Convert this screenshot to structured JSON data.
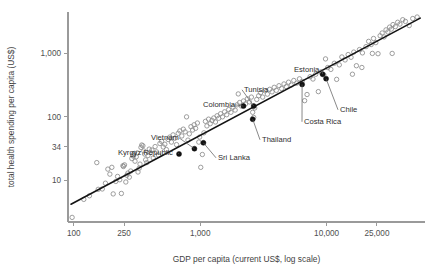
{
  "chart_data": {
    "type": "scatter",
    "title": "",
    "xlabel": "GDP per capita (current US$, log scale)",
    "ylabel": "total health spending per capita (US$)",
    "xscale": "log",
    "yscale": "log",
    "grid": false,
    "legend": "none",
    "xlim": [
      90,
      60000
    ],
    "ylim": [
      2.2,
      4500
    ],
    "xticks": [
      {
        "value": 100,
        "label": "100"
      },
      {
        "value": 250,
        "label": "250"
      },
      {
        "value": 1000,
        "label": "1,000"
      },
      {
        "value": 10000,
        "label": "10,000"
      },
      {
        "value": 25000,
        "label": "25,000"
      }
    ],
    "yticks": [
      {
        "value": 1000,
        "label": "1,000"
      },
      {
        "value": 100,
        "label": "100"
      },
      {
        "value": 34,
        "label": "34"
      },
      {
        "value": 10,
        "label": "10"
      }
    ],
    "trendline": {
      "x": [
        95,
        55000
      ],
      "y": [
        4.2,
        3600
      ]
    },
    "series": [
      {
        "name": "countries",
        "marker": "open-circle",
        "points": [
          [
            97,
            2.6
          ],
          [
            120,
            5.0
          ],
          [
            133,
            5.7
          ],
          [
            152,
            19.0
          ],
          [
            156,
            7.2
          ],
          [
            168,
            7.3
          ],
          [
            178,
            9.0
          ],
          [
            186,
            15.0
          ],
          [
            193,
            12.5
          ],
          [
            200,
            16.0
          ],
          [
            205,
            6.1
          ],
          [
            215,
            9.6
          ],
          [
            222,
            11.5
          ],
          [
            231,
            10.2
          ],
          [
            238,
            6.2
          ],
          [
            245,
            17.0
          ],
          [
            247,
            16.5
          ],
          [
            252,
            17.5
          ],
          [
            258,
            9.4
          ],
          [
            263,
            12.0
          ],
          [
            268,
            13.0
          ],
          [
            275,
            11.2
          ],
          [
            282,
            14.0
          ],
          [
            288,
            22.0
          ],
          [
            292,
            25.0
          ],
          [
            296,
            24.0
          ],
          [
            301,
            26.5
          ],
          [
            305,
            20.0
          ],
          [
            312,
            23.5
          ],
          [
            318,
            27.0
          ],
          [
            322,
            13.5
          ],
          [
            329,
            15.5
          ],
          [
            334,
            18.0
          ],
          [
            340,
            33.0
          ],
          [
            345,
            36.0
          ],
          [
            352,
            35.0
          ],
          [
            358,
            29.0
          ],
          [
            363,
            26.0
          ],
          [
            370,
            21.0
          ],
          [
            378,
            19.0
          ],
          [
            386,
            24.5
          ],
          [
            395,
            31.0
          ],
          [
            404,
            27.5
          ],
          [
            415,
            30.0
          ],
          [
            425,
            22.5
          ],
          [
            440,
            34.0
          ],
          [
            452,
            28.0
          ],
          [
            468,
            25.0
          ],
          [
            480,
            38.0
          ],
          [
            495,
            41.0
          ],
          [
            510,
            33.5
          ],
          [
            525,
            37.0
          ],
          [
            540,
            30.5
          ],
          [
            558,
            44.0
          ],
          [
            575,
            48.0
          ],
          [
            592,
            40.0
          ],
          [
            610,
            52.0
          ],
          [
            630,
            46.0
          ],
          [
            650,
            36.5
          ],
          [
            670,
            55.0
          ],
          [
            690,
            60.0
          ],
          [
            715,
            50.0
          ],
          [
            735,
            64.0
          ],
          [
            760,
            58.0
          ],
          [
            780,
            100.0
          ],
          [
            800,
            43.0
          ],
          [
            820,
            54.0
          ],
          [
            845,
            70.0
          ],
          [
            870,
            62.0
          ],
          [
            895,
            75.0
          ],
          [
            920,
            66.0
          ],
          [
            950,
            80.0
          ],
          [
            975,
            40.0
          ],
          [
            990,
            48.0
          ],
          [
            1010,
            16.0
          ],
          [
            1040,
            25.5
          ],
          [
            1070,
            56.0
          ],
          [
            1100,
            85.0
          ],
          [
            1130,
            72.0
          ],
          [
            1165,
            92.0
          ],
          [
            1200,
            78.0
          ],
          [
            1240,
            88.0
          ],
          [
            1280,
            96.0
          ],
          [
            1320,
            83.0
          ],
          [
            1360,
            104.0
          ],
          [
            1400,
            95.0
          ],
          [
            1450,
            112.0
          ],
          [
            1500,
            100.0
          ],
          [
            1560,
            120.0
          ],
          [
            1620,
            108.0
          ],
          [
            1680,
            130.0
          ],
          [
            1750,
            118.0
          ],
          [
            1820,
            142.0
          ],
          [
            1890,
            128.0
          ],
          [
            1960,
            155.0
          ],
          [
            2000,
            230.0
          ],
          [
            2050,
            168.0
          ],
          [
            2120,
            148.0
          ],
          [
            2200,
            178.0
          ],
          [
            2280,
            160.0
          ],
          [
            2360,
            192.0
          ],
          [
            2450,
            172.0
          ],
          [
            2540,
            205.0
          ],
          [
            2600,
            118.0
          ],
          [
            2650,
            98.0
          ],
          [
            2700,
            138.0
          ],
          [
            2800,
            188.0
          ],
          [
            2900,
            215.0
          ],
          [
            3000,
            240.0
          ],
          [
            3120,
            205.0
          ],
          [
            3250,
            258.0
          ],
          [
            3400,
            228.0
          ],
          [
            3550,
            272.0
          ],
          [
            3700,
            248.0
          ],
          [
            3850,
            292.0
          ],
          [
            4000,
            262.0
          ],
          [
            4200,
            310.0
          ],
          [
            4400,
            280.0
          ],
          [
            4600,
            330.0
          ],
          [
            4800,
            300.0
          ],
          [
            5000,
            352.0
          ],
          [
            5250,
            318.0
          ],
          [
            5500,
            375.0
          ],
          [
            5800,
            340.0
          ],
          [
            6100,
            398.0
          ],
          [
            6400,
            362.0
          ],
          [
            6700,
            180.0
          ],
          [
            7000,
            225.0
          ],
          [
            7400,
            430.0
          ],
          [
            7800,
            395.0
          ],
          [
            8200,
            470.0
          ],
          [
            8600,
            250.0
          ],
          [
            9000,
            510.0
          ],
          [
            9500,
            460.0
          ],
          [
            9800,
            820.0
          ],
          [
            10200,
            600.0
          ],
          [
            10800,
            560.0
          ],
          [
            11500,
            700.0
          ],
          [
            12000,
            390.0
          ],
          [
            12600,
            660.0
          ],
          [
            13200,
            880.0
          ],
          [
            14000,
            790.0
          ],
          [
            14800,
            960.0
          ],
          [
            15600,
            870.0
          ],
          [
            16400,
            1050.0
          ],
          [
            17200,
            640.0
          ],
          [
            18200,
            1150.0
          ],
          [
            19200,
            1020.0
          ],
          [
            20500,
            1280.0
          ],
          [
            21500,
            1550.0
          ],
          [
            22500,
            1380.0
          ],
          [
            23500,
            1720.0
          ],
          [
            24500,
            1480.0
          ],
          [
            25500,
            990.0
          ],
          [
            26500,
            1900.0
          ],
          [
            27500,
            2100.0
          ],
          [
            28500,
            1820.0
          ],
          [
            29500,
            2350.0
          ],
          [
            30500,
            2180.0
          ],
          [
            31500,
            2600.0
          ],
          [
            32500,
            2420.0
          ],
          [
            33500,
            2850.0
          ],
          [
            35000,
            2650.0
          ],
          [
            36500,
            3100.0
          ],
          [
            38000,
            2900.0
          ],
          [
            40000,
            3400.0
          ],
          [
            42000,
            3200.0
          ],
          [
            45000,
            2750.0
          ],
          [
            48000,
            3550.0
          ],
          [
            52000,
            3750.0
          ],
          [
            33000,
            1000.0
          ],
          [
            23000,
            1000.0
          ],
          [
            19000,
            600.0
          ],
          [
            16000,
            470.0
          ]
        ]
      }
    ],
    "highlighted": [
      {
        "name": "Kyrgyz Republic",
        "x": 680,
        "y": 26.0,
        "label_x": 118,
        "label_y": 155
      },
      {
        "name": "Vietnam",
        "x": 900,
        "y": 31.5,
        "label_x": 151,
        "label_y": 140
      },
      {
        "name": "Sri Lanka",
        "x": 1060,
        "y": 39.0,
        "label_x": 218,
        "label_y": 160
      },
      {
        "name": "Colombia",
        "x": 2200,
        "y": 148.0,
        "label_x": 203,
        "label_y": 107
      },
      {
        "name": "Thailand",
        "x": 2600,
        "y": 92.0,
        "label_x": 262,
        "label_y": 142
      },
      {
        "name": "Tunisia",
        "x": 2650,
        "y": 148.0,
        "label_x": 244,
        "label_y": 92
      },
      {
        "name": "Costa Rica",
        "x": 6400,
        "y": 325.0,
        "label_x": 304,
        "label_y": 124
      },
      {
        "name": "Estonia",
        "x": 9300,
        "y": 470.0,
        "label_x": 294,
        "label_y": 72
      },
      {
        "name": "Chile",
        "x": 9900,
        "y": 400.0,
        "label_x": 340,
        "label_y": 112
      }
    ]
  }
}
